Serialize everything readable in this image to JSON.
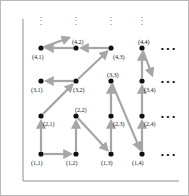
{
  "figure": {
    "background": "#ffffff",
    "border_color": "#b9b9b9",
    "arrow_color": "#a6a6a6",
    "node_color": "#111111",
    "label_color": "#1a1a1a",
    "axis_color": "#8f8f8f"
  },
  "geometry": {
    "columns_x": [
      40,
      75,
      110,
      141
    ],
    "rows_y": [
      153,
      115,
      80,
      47
    ],
    "node_radius": 2.6
  },
  "nodes": [
    {
      "id": "n-1-1",
      "label": "(1,1)",
      "col": 1,
      "row": 1,
      "x": 40,
      "y": 153,
      "label_x": 30,
      "label_y": 159,
      "label_pos": "below-left"
    },
    {
      "id": "n-1-2",
      "label": "(1,2)",
      "col": 2,
      "row": 1,
      "x": 75,
      "y": 153,
      "label_x": 65,
      "label_y": 159,
      "label_pos": "below-left"
    },
    {
      "id": "n-1-3",
      "label": "(1,3)",
      "col": 3,
      "row": 1,
      "x": 110,
      "y": 153,
      "label_x": 100,
      "label_y": 159,
      "label_pos": "below-left"
    },
    {
      "id": "n-1-4",
      "label": "(1,4)",
      "col": 4,
      "row": 1,
      "x": 141,
      "y": 153,
      "label_x": 131,
      "label_y": 159,
      "label_pos": "below-left"
    },
    {
      "id": "n-2-1",
      "label": "(2,1)",
      "col": 1,
      "row": 2,
      "x": 40,
      "y": 115,
      "label_x": 42,
      "label_y": 120,
      "label_pos": "right"
    },
    {
      "id": "n-2-2",
      "label": "(2,2)",
      "col": 2,
      "row": 2,
      "x": 75,
      "y": 115,
      "label_x": 74,
      "label_y": 106,
      "label_pos": "above"
    },
    {
      "id": "n-2-3",
      "label": "(2,3)",
      "col": 3,
      "row": 2,
      "x": 110,
      "y": 115,
      "label_x": 112,
      "label_y": 120,
      "label_pos": "right"
    },
    {
      "id": "n-2-4",
      "label": "(2,4)",
      "col": 4,
      "row": 2,
      "x": 141,
      "y": 115,
      "label_x": 143,
      "label_y": 120,
      "label_pos": "right"
    },
    {
      "id": "n-3-1",
      "label": "(3,1)",
      "col": 1,
      "row": 3,
      "x": 40,
      "y": 80,
      "label_x": 30,
      "label_y": 86,
      "label_pos": "below-left"
    },
    {
      "id": "n-3-2",
      "label": "(3,2)",
      "col": 2,
      "row": 3,
      "x": 75,
      "y": 80,
      "label_x": 72,
      "label_y": 86,
      "label_pos": "below"
    },
    {
      "id": "n-3-3",
      "label": "(3,3)",
      "col": 3,
      "row": 3,
      "x": 110,
      "y": 80,
      "label_x": 106,
      "label_y": 71,
      "label_pos": "above"
    },
    {
      "id": "n-3-4",
      "label": "(3,4)",
      "col": 4,
      "row": 3,
      "x": 141,
      "y": 80,
      "label_x": 143,
      "label_y": 86,
      "label_pos": "below-right"
    },
    {
      "id": "n-4-1",
      "label": "(4,1)",
      "col": 1,
      "row": 4,
      "x": 40,
      "y": 47,
      "label_x": 31,
      "label_y": 53,
      "label_pos": "below-left"
    },
    {
      "id": "n-4-2",
      "label": "(4,2)",
      "col": 2,
      "row": 4,
      "x": 75,
      "y": 47,
      "label_x": 71,
      "label_y": 38,
      "label_pos": "above"
    },
    {
      "id": "n-4-3",
      "label": "(4,3)",
      "col": 3,
      "row": 4,
      "x": 110,
      "y": 47,
      "label_x": 112,
      "label_y": 53,
      "label_pos": "below-right"
    },
    {
      "id": "n-4-4",
      "label": "(4,4)",
      "col": 4,
      "row": 4,
      "x": 141,
      "y": 47,
      "label_x": 137,
      "label_y": 38,
      "label_pos": "above"
    }
  ],
  "arrows": [
    {
      "id": "a-11-12",
      "from": "n-1-1",
      "to": "n-1-2",
      "x1": 40,
      "y1": 153,
      "x2": 75,
      "y2": 153
    },
    {
      "id": "a-12-22",
      "from": "n-1-2",
      "to": "n-2-2",
      "x1": 75,
      "y1": 153,
      "x2": 75,
      "y2": 115
    },
    {
      "id": "a-22-13",
      "from": "n-2-2",
      "to": "n-1-3",
      "x1": 75,
      "y1": 115,
      "x2": 110,
      "y2": 153
    },
    {
      "id": "a-13-23",
      "from": "n-1-3",
      "to": "n-2-3",
      "x1": 110,
      "y1": 153,
      "x2": 110,
      "y2": 115
    },
    {
      "id": "a-23-33",
      "from": "n-2-3",
      "to": "n-3-3",
      "x1": 110,
      "y1": 115,
      "x2": 110,
      "y2": 80
    },
    {
      "id": "a-33-14",
      "from": "n-3-3",
      "to": "n-1-4",
      "x1": 110,
      "y1": 80,
      "x2": 141,
      "y2": 153
    },
    {
      "id": "a-14-24",
      "from": "n-1-4",
      "to": "n-2-4",
      "x1": 141,
      "y1": 153,
      "x2": 141,
      "y2": 115
    },
    {
      "id": "a-24-34",
      "from": "n-2-4",
      "to": "n-3-4",
      "x1": 141,
      "y1": 115,
      "x2": 141,
      "y2": 80
    },
    {
      "id": "a-34-44",
      "from": "n-3-4",
      "to": "n-4-4",
      "x1": 141,
      "y1": 80,
      "x2": 141,
      "y2": 47
    },
    {
      "id": "a-44-out",
      "from": "n-4-4",
      "to": "offgrid-down-right",
      "x1": 141,
      "y1": 47,
      "x2": 153,
      "y2": 79
    },
    {
      "id": "a-43-42",
      "from": "n-4-3",
      "to": "n-4-2",
      "x1": 110,
      "y1": 47,
      "x2": 75,
      "y2": 47
    },
    {
      "id": "a-42-41",
      "from": "n-4-2",
      "to": "n-4-1",
      "x1": 75,
      "y1": 47,
      "x2": 40,
      "y2": 47
    },
    {
      "id": "a-32-43",
      "from": "n-3-2",
      "to": "n-4-3",
      "x1": 75,
      "y1": 80,
      "x2": 110,
      "y2": 47
    },
    {
      "id": "a-32-31",
      "from": "n-3-2",
      "to": "n-3-1",
      "x1": 75,
      "y1": 80,
      "x2": 40,
      "y2": 80
    },
    {
      "id": "a-21-32",
      "from": "n-2-1",
      "to": "n-3-2",
      "x1": 40,
      "y1": 115,
      "x2": 75,
      "y2": 80
    },
    {
      "id": "a-11-21",
      "from": "n-1-1",
      "to": "n-2-1",
      "x1": 40,
      "y1": 153,
      "x2": 40,
      "y2": 115
    },
    {
      "id": "a-41-out",
      "from": "n-4-1",
      "to": "offgrid-up-right",
      "x1": 40,
      "y1": 47,
      "x2": 73,
      "y2": 35
    }
  ],
  "vertical_ellipses": [
    {
      "id": "vdots-col-1",
      "glyph": "⋮",
      "x": 40,
      "y": 13
    },
    {
      "id": "vdots-col-2",
      "glyph": "⋮",
      "x": 75,
      "y": 13
    },
    {
      "id": "vdots-col-3",
      "glyph": "⋮",
      "x": 110,
      "y": 13
    },
    {
      "id": "vdots-col-4",
      "glyph": "⋮",
      "x": 141,
      "y": 13
    }
  ],
  "horizontal_ellipses": [
    {
      "id": "hdots-row-4",
      "glyph": "⋯",
      "x": 160,
      "y": 44
    },
    {
      "id": "hdots-row-3",
      "glyph": "⋯",
      "x": 160,
      "y": 77
    },
    {
      "id": "hdots-row-2",
      "glyph": "⋯",
      "x": 160,
      "y": 112
    },
    {
      "id": "hdots-row-1",
      "glyph": "⋯",
      "x": 160,
      "y": 150
    }
  ],
  "axis": {
    "id": "axis-frame",
    "vertical": {
      "x": 22,
      "y1": 18,
      "y2": 180
    },
    "horizontal": {
      "y": 180,
      "x1": 22,
      "x2": 178
    }
  }
}
